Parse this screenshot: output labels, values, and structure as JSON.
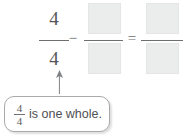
{
  "problem": {
    "equation": {
      "left_fraction": {
        "numerator": "4",
        "denominator": "4"
      },
      "operator_subtract": "−",
      "middle_fraction": {
        "numerator": "",
        "denominator": "",
        "numerator_state": "blank",
        "denominator_state": "blank"
      },
      "operator_equals": "=",
      "right_fraction": {
        "numerator": "",
        "denominator": "",
        "numerator_state": "blank",
        "denominator_state": "blank"
      }
    },
    "callout": {
      "fraction": {
        "numerator": "4",
        "denominator": "4"
      },
      "text": "is one whole.",
      "points_to": "left-fraction-denominator"
    }
  },
  "icons": {
    "arrow": "arrow-up-icon"
  },
  "colors": {
    "text": "#58585a",
    "rule": "#6e6f71",
    "blank_fill": "#ebecec",
    "blank_border": "#e4e5e5",
    "callout_border": "#a7a9ac",
    "arrow": "#808285",
    "page_background": "#ffffff"
  }
}
